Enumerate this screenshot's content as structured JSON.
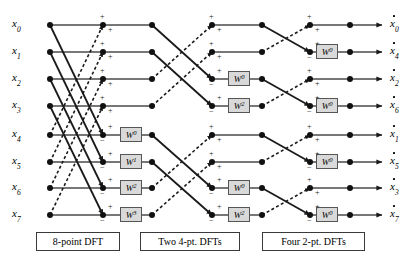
{
  "diagram": {
    "rows": 8,
    "row_y": [
      25,
      52,
      79,
      106,
      135,
      162,
      188,
      215
    ],
    "colors": {
      "line": "#2b2b2b",
      "node": "#111111",
      "wbox_fill": "#d9d9d9",
      "wbox_border": "#555555",
      "caption_border": "#3a3a3a"
    }
  },
  "inputs": [
    {
      "name": "x",
      "index": "0",
      "y": 25
    },
    {
      "name": "x",
      "index": "1",
      "y": 52
    },
    {
      "name": "x",
      "index": "2",
      "y": 79
    },
    {
      "name": "x",
      "index": "3",
      "y": 106
    },
    {
      "name": "x",
      "index": "4",
      "y": 135
    },
    {
      "name": "x",
      "index": "5",
      "y": 162
    },
    {
      "name": "x",
      "index": "6",
      "y": 188
    },
    {
      "name": "x",
      "index": "7",
      "y": 215
    }
  ],
  "outputs": [
    {
      "name": "x",
      "index": "0",
      "y": 25
    },
    {
      "name": "x",
      "index": "4",
      "y": 52
    },
    {
      "name": "x",
      "index": "2",
      "y": 79
    },
    {
      "name": "x",
      "index": "6",
      "y": 106
    },
    {
      "name": "x",
      "index": "1",
      "y": 135
    },
    {
      "name": "x",
      "index": "5",
      "y": 162
    },
    {
      "name": "x",
      "index": "3",
      "y": 188
    },
    {
      "name": "x",
      "index": "7",
      "y": 215
    }
  ],
  "twiddles": [
    {
      "stage": 1,
      "row": 4,
      "base": "W",
      "exp": "0",
      "x": 120,
      "y": 135
    },
    {
      "stage": 1,
      "row": 5,
      "base": "W",
      "exp": "1",
      "x": 120,
      "y": 162
    },
    {
      "stage": 1,
      "row": 6,
      "base": "W",
      "exp": "2",
      "x": 120,
      "y": 188
    },
    {
      "stage": 1,
      "row": 7,
      "base": "W",
      "exp": "3",
      "x": 120,
      "y": 215
    },
    {
      "stage": 2,
      "row": 2,
      "base": "W",
      "exp": "0",
      "x": 228,
      "y": 79
    },
    {
      "stage": 2,
      "row": 3,
      "base": "W",
      "exp": "2",
      "x": 228,
      "y": 106
    },
    {
      "stage": 2,
      "row": 6,
      "base": "W",
      "exp": "0",
      "x": 228,
      "y": 188
    },
    {
      "stage": 2,
      "row": 7,
      "base": "W",
      "exp": "2",
      "x": 228,
      "y": 215
    },
    {
      "stage": 3,
      "row": 1,
      "base": "W",
      "exp": "0",
      "x": 316,
      "y": 52
    },
    {
      "stage": 3,
      "row": 3,
      "base": "W",
      "exp": "0",
      "x": 316,
      "y": 106
    },
    {
      "stage": 3,
      "row": 5,
      "base": "W",
      "exp": "0",
      "x": 316,
      "y": 162
    },
    {
      "stage": 3,
      "row": 7,
      "base": "W",
      "exp": "0",
      "x": 316,
      "y": 215
    }
  ],
  "captions": [
    {
      "id": "caption-8pt",
      "text": "8-point DFT",
      "x": 36,
      "y": 232,
      "w": 84,
      "h": 19
    },
    {
      "id": "caption-two4pt",
      "text": "Two 4-pt. DFTs",
      "x": 140,
      "y": 232,
      "w": 100,
      "h": 19
    },
    {
      "id": "caption-four2pt",
      "text": "Four 2-pt. DFTs",
      "x": 262,
      "y": 232,
      "w": 103,
      "h": 19
    }
  ],
  "signs": {
    "plus": "+",
    "minus": "−"
  },
  "stage_x": {
    "input_node": 50,
    "stage1_out": 103,
    "stage1_w_out": 152,
    "stage2_out": 212,
    "stage2_w_out": 262,
    "stage3_out": 310,
    "stage3_w_out": 350,
    "arrow_end": 382
  }
}
